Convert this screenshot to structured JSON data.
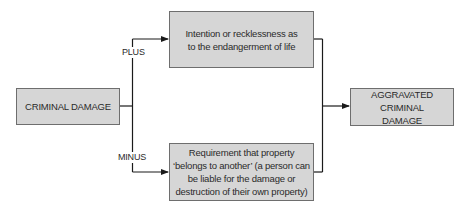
{
  "diagram": {
    "nodes": {
      "criminal_damage": {
        "label": "CRIMINAL DAMAGE"
      },
      "intention": {
        "label": "Intention or recklessness as to the endangerment of life"
      },
      "requirement": {
        "label": "Requirement that property ‘belongs to another’ (a person can be liable for the damage or destruction of their own property)"
      },
      "aggravated": {
        "label": "AGGRAVATED CRIMINAL DAMAGE"
      }
    },
    "edges": {
      "plus": {
        "label": "PLUS",
        "from": "criminal_damage",
        "to": "intention"
      },
      "minus": {
        "label": "MINUS",
        "from": "criminal_damage",
        "to": "requirement"
      },
      "to_result": {
        "from": [
          "intention",
          "requirement"
        ],
        "to": "aggravated"
      }
    },
    "colors": {
      "box_fill": "#d6d6d6",
      "box_border": "#6e6e6e",
      "line": "#1a1a1a",
      "text": "#2a2a2a"
    }
  }
}
